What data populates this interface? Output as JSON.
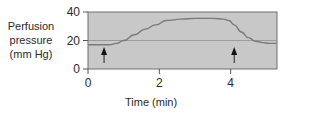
{
  "chart_data": {
    "type": "line",
    "title": "",
    "xlabel": "Time (min)",
    "ylabel": [
      "Perfusion",
      "pressure",
      "(mm Hg)"
    ],
    "xlim": [
      0,
      5.3
    ],
    "ylim": [
      0,
      40
    ],
    "x_ticks": [
      0,
      2,
      4
    ],
    "y_ticks": [
      0,
      20,
      40
    ],
    "grid": {
      "horizontal": [
        20
      ]
    },
    "plot_background": "#c8c8c8",
    "line_color": "#7a7a7a",
    "series": [
      {
        "name": "Perfusion pressure",
        "x": [
          0,
          0.3,
          0.6,
          0.8,
          1.0,
          1.3,
          1.6,
          1.9,
          2.2,
          2.6,
          3.0,
          3.5,
          3.8,
          3.95,
          4.1,
          4.3,
          4.5,
          4.7,
          4.9,
          5.1,
          5.3
        ],
        "y": [
          17,
          17,
          17,
          18,
          20,
          24,
          28,
          31,
          34,
          35,
          35.5,
          35.5,
          35,
          34,
          31,
          26,
          22,
          19.5,
          18.5,
          18,
          18
        ]
      }
    ],
    "annotations": [
      {
        "type": "arrow",
        "direction": "up",
        "x": 0.45,
        "label": ""
      },
      {
        "type": "arrow",
        "direction": "up",
        "x": 4.1,
        "label": ""
      }
    ]
  }
}
